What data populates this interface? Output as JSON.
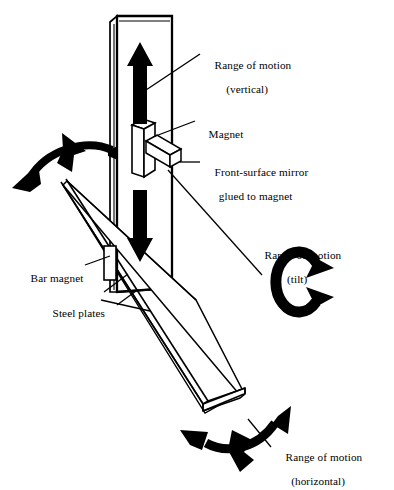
{
  "figure": {
    "background_color": "#ffffff",
    "ink_color": "#000000",
    "width": 394,
    "height": 490
  },
  "labels": {
    "range_vertical": {
      "line1": "Range of motion",
      "line2": "(vertical)"
    },
    "magnet": {
      "line1": "Magnet"
    },
    "mirror": {
      "line1": "Front-surface mirror",
      "line2": "glued to magnet"
    },
    "range_tilt": {
      "line1": "Range of motion",
      "line2": "(tilt)"
    },
    "bar_magnet": {
      "line1": "Bar magnet"
    },
    "steel_plates": {
      "line1": "Steel plates"
    },
    "range_horizontal": {
      "line1": "Range of motion",
      "line2": "(horizontal)"
    }
  },
  "parts": {
    "vertical_post": "vertical-post",
    "magnet_block": "magnet-block",
    "mirror_bar": "mirror-bar",
    "bar_magnet_block": "bar-magnet-block",
    "steel_plate_upper": "steel-plate-upper",
    "steel_plate_lower": "steel-plate-lower"
  },
  "motion_arrows": {
    "vertical_up": "arrow-up",
    "vertical_down": "arrow-down",
    "tilt": "circular-arrow-tilt",
    "horizontal": "curved-arrow-horizontal",
    "upper_left": "curved-arrow-upper-left"
  }
}
